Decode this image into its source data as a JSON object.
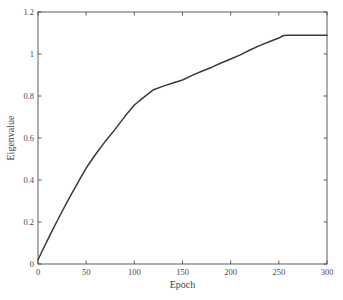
{
  "chart_data": {
    "type": "line",
    "title": "",
    "xlabel": "Epoch",
    "ylabel": "Eigenvalue",
    "xlim": [
      0,
      300
    ],
    "ylim": [
      0,
      1.2
    ],
    "xticks": [
      0,
      50,
      100,
      150,
      200,
      250,
      300
    ],
    "xticklabels": [
      "0",
      "50",
      "100",
      "150",
      "200",
      "250",
      "300"
    ],
    "yticks": [
      0,
      0.2,
      0.4,
      0.6,
      0.8,
      1,
      1.2
    ],
    "yticklabels": [
      "0",
      "0.2",
      "0.4",
      "0.6",
      "0.8",
      "1",
      "1.2"
    ],
    "grid": false,
    "legend": null,
    "line_color": "#3a3a3a",
    "axis_color": "#4d4d4d",
    "background_color": "#ffffff",
    "series": [
      {
        "name": "Eigenvalue",
        "x": [
          0,
          5,
          10,
          15,
          20,
          25,
          30,
          35,
          40,
          45,
          50,
          60,
          70,
          80,
          90,
          100,
          110,
          120,
          130,
          140,
          150,
          160,
          170,
          180,
          190,
          200,
          210,
          220,
          230,
          240,
          250,
          255,
          260,
          270,
          280,
          290,
          300
        ],
        "y": [
          0.02,
          0.068,
          0.115,
          0.161,
          0.206,
          0.25,
          0.293,
          0.335,
          0.376,
          0.417,
          0.457,
          0.524,
          0.585,
          0.641,
          0.702,
          0.757,
          0.795,
          0.83,
          0.847,
          0.862,
          0.876,
          0.898,
          0.918,
          0.936,
          0.957,
          0.976,
          0.996,
          1.019,
          1.04,
          1.058,
          1.076,
          1.088,
          1.089,
          1.089,
          1.089,
          1.089,
          1.089
        ]
      }
    ]
  },
  "figure": {
    "plot_box": {
      "left": 38,
      "top": 12,
      "right": 327,
      "bottom": 264
    }
  }
}
